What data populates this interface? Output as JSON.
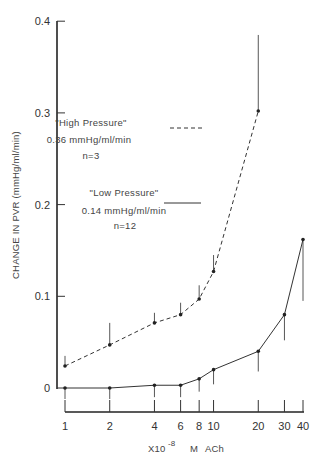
{
  "chart_data": {
    "type": "line",
    "title": "",
    "xlabel": "X10^-8 M ACh",
    "xlabel_parts": {
      "prefix": "X10",
      "exponent": "-8",
      "unit": "M",
      "agent": "ACh"
    },
    "ylabel": "CHANGE IN PVR (mmHg/ml/min)",
    "xscale": "log",
    "ylim": [
      0,
      0.4
    ],
    "yticks": [
      "0",
      "0.1",
      "0.2",
      "0.3",
      "0.4"
    ],
    "xticks": [
      "1",
      "2",
      "4",
      "6",
      "8",
      "10",
      "20",
      "30",
      "40"
    ],
    "grid": false,
    "series": [
      {
        "name": "\"High Pressure\"",
        "baseline": "0.36 mmHg/ml/min",
        "n": "n=3",
        "style": "dashed",
        "x": [
          1,
          2,
          4,
          6,
          8,
          10,
          20
        ],
        "y": [
          0.024,
          0.047,
          0.071,
          0.08,
          0.097,
          0.127,
          0.302
        ],
        "error_upper": [
          0.035,
          0.071,
          0.082,
          0.093,
          0.112,
          0.145,
          0.385
        ]
      },
      {
        "name": "\"Low Pressure\"",
        "baseline": "0.14 mmHg/ml/min",
        "n": "n=12",
        "style": "solid",
        "x": [
          1,
          2,
          4,
          6,
          8,
          10,
          20,
          30,
          40
        ],
        "y": [
          0.0,
          0.0,
          0.003,
          0.003,
          0.01,
          0.02,
          0.04,
          0.08,
          0.162
        ],
        "error_lower": [
          -0.012,
          -0.012,
          -0.01,
          -0.01,
          -0.004,
          0.004,
          0.018,
          0.052,
          0.095
        ]
      }
    ]
  },
  "legend": {
    "high": {
      "label": "\"High Pressure\"",
      "baseline": "0.36 mmHg/ml/min",
      "n": "n=3"
    },
    "low": {
      "label": "\"Low Pressure\"",
      "baseline": "0.14 mmHg/ml/min",
      "n": "n=12"
    }
  },
  "axes": {
    "ylabel": "CHANGE IN PVR (mmHg/ml/min)",
    "xlabel_prefix": "X10",
    "xlabel_exp": "-8",
    "xlabel_unit": "M",
    "xlabel_agent": "ACh"
  }
}
